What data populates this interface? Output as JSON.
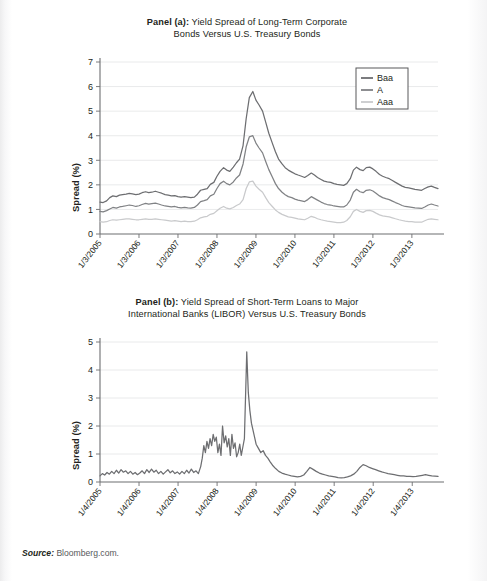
{
  "figure": {
    "source_label": "Source:",
    "source_value": "Bloomberg.com."
  },
  "panel_a": {
    "title_line1_bold": "Panel (a):",
    "title_line1_rest": " Yield Spread of Long-Term Corporate",
    "title_line2": "Bonds Versus U.S. Treasury Bonds",
    "ylabel": "Spread (%)"
  },
  "panel_b": {
    "title_line1_bold": "Panel (b):",
    "title_line1_rest": " Yield Spread of Short-Term Loans to Major",
    "title_line2": "International Banks (LIBOR) Versus U.S. Treasury Bonds",
    "ylabel": "Spread (%)"
  },
  "colors": {
    "baa": "#6d6e71",
    "a": "#808285",
    "aaa": "#c9cacc",
    "libor": "#6d6e71",
    "grid": "#e3e4e6",
    "axis": "#6d6e71",
    "text": "#231f20"
  },
  "chart_data": [
    {
      "type": "line",
      "id": "panel-a",
      "title": "Panel (a): Yield Spread of Long-Term Corporate Bonds Versus U.S. Treasury Bonds",
      "xlabel": "",
      "ylabel": "Spread (%)",
      "ylim": [
        0,
        7
      ],
      "yticks": [
        0,
        1,
        2,
        3,
        4,
        5,
        6,
        7
      ],
      "ytick_labels": [
        "0",
        "1",
        "2",
        "3",
        "4",
        "5",
        "6",
        "7"
      ],
      "grid": true,
      "legend_position": "top-right",
      "xtick_labels": [
        "1/3/2005",
        "1/3/2006",
        "1/3/2007",
        "1/3/2008",
        "1/3/2009",
        "1/3/2010",
        "1/3/2011",
        "1/3/2012",
        "1/3/2013"
      ],
      "x": [
        2005.0,
        2005.08,
        2005.17,
        2005.25,
        2005.33,
        2005.42,
        2005.5,
        2005.58,
        2005.67,
        2005.75,
        2005.83,
        2005.92,
        2006.0,
        2006.08,
        2006.17,
        2006.25,
        2006.33,
        2006.42,
        2006.5,
        2006.58,
        2006.67,
        2006.75,
        2006.83,
        2006.92,
        2007.0,
        2007.08,
        2007.17,
        2007.25,
        2007.33,
        2007.42,
        2007.5,
        2007.58,
        2007.67,
        2007.75,
        2007.83,
        2007.92,
        2008.0,
        2008.08,
        2008.17,
        2008.25,
        2008.33,
        2008.42,
        2008.5,
        2008.58,
        2008.67,
        2008.75,
        2008.83,
        2008.92,
        2009.0,
        2009.08,
        2009.17,
        2009.25,
        2009.33,
        2009.42,
        2009.5,
        2009.58,
        2009.67,
        2009.75,
        2009.83,
        2009.92,
        2010.0,
        2010.08,
        2010.17,
        2010.25,
        2010.33,
        2010.42,
        2010.5,
        2010.58,
        2010.67,
        2010.75,
        2010.83,
        2010.92,
        2011.0,
        2011.08,
        2011.17,
        2011.25,
        2011.33,
        2011.42,
        2011.5,
        2011.58,
        2011.67,
        2011.75,
        2011.83,
        2011.92,
        2012.0,
        2012.08,
        2012.17,
        2012.25,
        2012.33,
        2012.42,
        2012.5,
        2012.58,
        2012.67,
        2012.75,
        2012.83,
        2012.92,
        2013.0,
        2013.08,
        2013.17,
        2013.25,
        2013.33,
        2013.42,
        2013.5,
        2013.58,
        2013.67
      ],
      "series": [
        {
          "name": "Baa",
          "color": "#6d6e71",
          "values": [
            1.3,
            1.28,
            1.35,
            1.48,
            1.55,
            1.52,
            1.58,
            1.6,
            1.62,
            1.65,
            1.63,
            1.6,
            1.62,
            1.68,
            1.72,
            1.68,
            1.7,
            1.74,
            1.7,
            1.66,
            1.6,
            1.58,
            1.55,
            1.56,
            1.52,
            1.5,
            1.52,
            1.5,
            1.48,
            1.5,
            1.62,
            1.78,
            1.82,
            1.85,
            2.02,
            2.1,
            2.35,
            2.55,
            2.7,
            2.6,
            2.55,
            2.72,
            2.9,
            3.05,
            3.6,
            4.7,
            5.55,
            5.8,
            5.45,
            5.25,
            5.0,
            4.55,
            4.1,
            3.7,
            3.35,
            3.05,
            2.85,
            2.7,
            2.6,
            2.52,
            2.45,
            2.4,
            2.35,
            2.3,
            2.38,
            2.48,
            2.4,
            2.3,
            2.22,
            2.15,
            2.12,
            2.1,
            2.05,
            2.02,
            2.0,
            1.98,
            2.05,
            2.25,
            2.6,
            2.72,
            2.62,
            2.58,
            2.7,
            2.72,
            2.65,
            2.55,
            2.42,
            2.35,
            2.3,
            2.25,
            2.18,
            2.1,
            2.02,
            1.95,
            1.9,
            1.88,
            1.85,
            1.82,
            1.8,
            1.78,
            1.85,
            1.92,
            1.95,
            1.9,
            1.85
          ]
        },
        {
          "name": "A",
          "color": "#808285",
          "values": [
            0.92,
            0.9,
            0.95,
            1.02,
            1.08,
            1.05,
            1.1,
            1.12,
            1.15,
            1.18,
            1.16,
            1.12,
            1.15,
            1.2,
            1.25,
            1.22,
            1.24,
            1.26,
            1.22,
            1.18,
            1.14,
            1.12,
            1.1,
            1.12,
            1.08,
            1.06,
            1.08,
            1.06,
            1.05,
            1.08,
            1.18,
            1.32,
            1.36,
            1.4,
            1.55,
            1.62,
            1.85,
            2.05,
            2.15,
            2.05,
            2.0,
            2.12,
            2.28,
            2.4,
            2.85,
            3.55,
            3.95,
            4.0,
            3.7,
            3.5,
            3.3,
            2.95,
            2.62,
            2.32,
            2.05,
            1.85,
            1.7,
            1.6,
            1.52,
            1.48,
            1.42,
            1.38,
            1.35,
            1.32,
            1.4,
            1.52,
            1.45,
            1.38,
            1.3,
            1.24,
            1.2,
            1.18,
            1.14,
            1.12,
            1.1,
            1.1,
            1.18,
            1.38,
            1.7,
            1.82,
            1.72,
            1.68,
            1.78,
            1.8,
            1.75,
            1.66,
            1.55,
            1.48,
            1.44,
            1.4,
            1.34,
            1.28,
            1.22,
            1.16,
            1.12,
            1.1,
            1.08,
            1.06,
            1.05,
            1.04,
            1.1,
            1.18,
            1.22,
            1.18,
            1.14
          ]
        },
        {
          "name": "Aaa",
          "color": "#c9cacc",
          "values": [
            0.5,
            0.48,
            0.5,
            0.55,
            0.58,
            0.56,
            0.58,
            0.6,
            0.62,
            0.62,
            0.6,
            0.58,
            0.58,
            0.6,
            0.62,
            0.6,
            0.6,
            0.62,
            0.6,
            0.58,
            0.56,
            0.54,
            0.52,
            0.54,
            0.52,
            0.5,
            0.52,
            0.5,
            0.5,
            0.52,
            0.58,
            0.66,
            0.7,
            0.72,
            0.8,
            0.84,
            0.95,
            1.05,
            1.12,
            1.05,
            1.02,
            1.08,
            1.16,
            1.22,
            1.4,
            1.85,
            2.12,
            2.15,
            1.95,
            1.82,
            1.7,
            1.48,
            1.28,
            1.12,
            0.98,
            0.88,
            0.8,
            0.75,
            0.7,
            0.68,
            0.65,
            0.62,
            0.6,
            0.58,
            0.64,
            0.72,
            0.68,
            0.62,
            0.58,
            0.55,
            0.52,
            0.5,
            0.48,
            0.46,
            0.46,
            0.48,
            0.55,
            0.7,
            0.92,
            1.0,
            0.92,
            0.88,
            0.95,
            0.96,
            0.92,
            0.85,
            0.78,
            0.74,
            0.72,
            0.7,
            0.66,
            0.62,
            0.58,
            0.55,
            0.52,
            0.5,
            0.5,
            0.48,
            0.48,
            0.48,
            0.54,
            0.6,
            0.62,
            0.6,
            0.58
          ]
        }
      ]
    },
    {
      "type": "line",
      "id": "panel-b",
      "title": "Panel (b): Yield Spread of Short-Term Loans to Major International Banks (LIBOR) Versus U.S. Treasury Bonds",
      "xlabel": "",
      "ylabel": "Spread (%)",
      "ylim": [
        0,
        5
      ],
      "yticks": [
        0,
        1,
        2,
        3,
        4,
        5
      ],
      "ytick_labels": [
        "0",
        "1",
        "2",
        "3",
        "4",
        "5"
      ],
      "grid": true,
      "legend_position": "none",
      "xtick_labels": [
        "1/4/2005",
        "1/4/2006",
        "1/4/2007",
        "1/4/2008",
        "1/4/2009",
        "1/4/2010",
        "1/4/2011",
        "1/4/2012",
        "1/4/2013"
      ],
      "x": [
        2005.0,
        2005.06,
        2005.12,
        2005.18,
        2005.24,
        2005.3,
        2005.36,
        2005.42,
        2005.48,
        2005.54,
        2005.6,
        2005.66,
        2005.72,
        2005.78,
        2005.84,
        2005.9,
        2005.96,
        2006.02,
        2006.08,
        2006.14,
        2006.2,
        2006.26,
        2006.32,
        2006.38,
        2006.44,
        2006.5,
        2006.56,
        2006.62,
        2006.68,
        2006.74,
        2006.8,
        2006.86,
        2006.92,
        2006.98,
        2007.04,
        2007.1,
        2007.16,
        2007.22,
        2007.28,
        2007.34,
        2007.4,
        2007.46,
        2007.52,
        2007.58,
        2007.62,
        2007.66,
        2007.7,
        2007.74,
        2007.78,
        2007.82,
        2007.86,
        2007.9,
        2007.94,
        2007.98,
        2008.02,
        2008.06,
        2008.1,
        2008.14,
        2008.18,
        2008.22,
        2008.26,
        2008.3,
        2008.34,
        2008.38,
        2008.42,
        2008.46,
        2008.5,
        2008.54,
        2008.58,
        2008.62,
        2008.66,
        2008.7,
        2008.72,
        2008.74,
        2008.76,
        2008.78,
        2008.8,
        2008.84,
        2008.88,
        2008.92,
        2008.96,
        2009.0,
        2009.06,
        2009.12,
        2009.18,
        2009.24,
        2009.3,
        2009.36,
        2009.42,
        2009.5,
        2009.58,
        2009.66,
        2009.74,
        2009.82,
        2009.9,
        2009.98,
        2010.06,
        2010.14,
        2010.22,
        2010.3,
        2010.38,
        2010.46,
        2010.54,
        2010.62,
        2010.7,
        2010.78,
        2010.86,
        2010.94,
        2011.02,
        2011.1,
        2011.18,
        2011.26,
        2011.34,
        2011.42,
        2011.5,
        2011.58,
        2011.66,
        2011.74,
        2011.82,
        2011.9,
        2011.98,
        2012.06,
        2012.14,
        2012.22,
        2012.3,
        2012.38,
        2012.46,
        2012.54,
        2012.62,
        2012.7,
        2012.78,
        2012.86,
        2012.94,
        2013.02,
        2013.1,
        2013.18,
        2013.26,
        2013.34,
        2013.42,
        2013.5,
        2013.58,
        2013.66
      ],
      "series": [
        {
          "name": "LIBOR spread",
          "color": "#6d6e71",
          "values": [
            0.22,
            0.3,
            0.25,
            0.34,
            0.28,
            0.38,
            0.3,
            0.42,
            0.32,
            0.44,
            0.35,
            0.4,
            0.3,
            0.38,
            0.28,
            0.34,
            0.26,
            0.32,
            0.4,
            0.3,
            0.44,
            0.34,
            0.46,
            0.35,
            0.42,
            0.3,
            0.38,
            0.28,
            0.36,
            0.44,
            0.33,
            0.4,
            0.3,
            0.36,
            0.28,
            0.38,
            0.3,
            0.42,
            0.32,
            0.46,
            0.34,
            0.4,
            0.3,
            0.55,
            0.85,
            1.3,
            1.05,
            1.45,
            1.2,
            1.55,
            1.3,
            1.7,
            1.45,
            1.6,
            1.05,
            1.35,
            0.95,
            2.0,
            1.4,
            1.65,
            1.25,
            1.55,
            0.95,
            1.7,
            1.2,
            1.4,
            0.9,
            1.05,
            1.35,
            0.95,
            1.25,
            1.55,
            2.6,
            3.6,
            4.65,
            3.9,
            3.2,
            2.55,
            2.1,
            1.85,
            1.6,
            1.35,
            1.2,
            1.05,
            1.12,
            0.95,
            0.85,
            0.72,
            0.6,
            0.48,
            0.38,
            0.32,
            0.28,
            0.25,
            0.22,
            0.2,
            0.18,
            0.2,
            0.25,
            0.38,
            0.52,
            0.45,
            0.38,
            0.32,
            0.28,
            0.25,
            0.22,
            0.2,
            0.18,
            0.16,
            0.15,
            0.16,
            0.18,
            0.22,
            0.28,
            0.38,
            0.52,
            0.62,
            0.58,
            0.52,
            0.48,
            0.44,
            0.4,
            0.36,
            0.33,
            0.3,
            0.28,
            0.26,
            0.24,
            0.22,
            0.22,
            0.2,
            0.2,
            0.19,
            0.2,
            0.22,
            0.24,
            0.26,
            0.24,
            0.22,
            0.21,
            0.2
          ]
        }
      ]
    }
  ]
}
